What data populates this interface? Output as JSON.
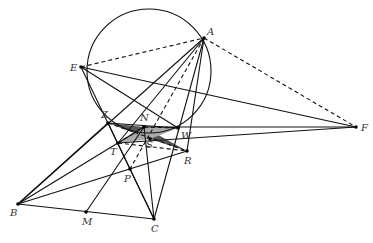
{
  "diagram": {
    "type": "geometry-figure",
    "circle": {
      "cx": 149,
      "cy": 71,
      "r": 62
    },
    "points": {
      "A": {
        "x": 204,
        "y": 38,
        "label": "A",
        "lx": 207,
        "ly": 35
      },
      "E": {
        "x": 81,
        "y": 67,
        "label": "E",
        "lx": 70,
        "ly": 71
      },
      "F": {
        "x": 356,
        "y": 127,
        "label": "F",
        "lx": 361,
        "ly": 131
      },
      "Z": {
        "x": 108,
        "y": 123,
        "label": "Z",
        "lx": 101,
        "ly": 118
      },
      "N": {
        "x": 144,
        "y": 127,
        "label": "N",
        "lx": 140,
        "ly": 121
      },
      "W": {
        "x": 178,
        "y": 128,
        "label": "W",
        "lx": 181,
        "ly": 139
      },
      "T": {
        "x": 118,
        "y": 143,
        "label": "T",
        "lx": 110,
        "ly": 155
      },
      "S": {
        "x": 150,
        "y": 139,
        "label": "S",
        "lx": 146,
        "ly": 148
      },
      "R": {
        "x": 187,
        "y": 151,
        "label": "R",
        "lx": 184,
        "ly": 164
      },
      "P": {
        "x": 130,
        "y": 169,
        "label": "P",
        "lx": 124,
        "ly": 182
      },
      "B": {
        "x": 18,
        "y": 204,
        "label": "B",
        "lx": 10,
        "ly": 216
      },
      "M": {
        "x": 86,
        "y": 212,
        "label": "M",
        "lx": 82,
        "ly": 225
      },
      "C": {
        "x": 154,
        "y": 219,
        "label": "C",
        "lx": 151,
        "ly": 232
      }
    },
    "solid_segments": [
      [
        "A",
        "B"
      ],
      [
        "A",
        "C"
      ],
      [
        "A",
        "T"
      ],
      [
        "A",
        "R"
      ],
      [
        "B",
        "C"
      ],
      [
        "B",
        "Z"
      ],
      [
        "B",
        "N"
      ],
      [
        "B",
        "R"
      ],
      [
        "C",
        "Z"
      ],
      [
        "C",
        "N"
      ],
      [
        "E",
        "F"
      ],
      [
        "E",
        "W"
      ],
      [
        "E",
        "C"
      ],
      [
        "F",
        "T"
      ],
      [
        "F",
        "N"
      ],
      [
        "M",
        "N"
      ],
      [
        "Z",
        "W"
      ]
    ],
    "dashed_segments": [
      [
        "E",
        "A"
      ],
      [
        "A",
        "F"
      ],
      [
        "A",
        "P"
      ],
      [
        "Z",
        "R"
      ],
      [
        "T",
        "R"
      ],
      [
        "T",
        "N"
      ],
      [
        "N",
        "W"
      ]
    ],
    "shaded_regions": [
      {
        "name": "dark-triangle",
        "points": [
          "Z",
          "N",
          "S"
        ],
        "fill": "#555555"
      },
      {
        "name": "dark-triangle-2",
        "points": [
          "N",
          "R",
          "S"
        ],
        "fill": "#555555"
      },
      {
        "name": "light-triangle",
        "points": [
          "N",
          "W",
          "S"
        ],
        "fill": "#aaaaaa"
      },
      {
        "name": "light-triangle-2",
        "points": [
          "T",
          "N",
          "S"
        ],
        "fill": "#aaaaaa"
      }
    ]
  }
}
